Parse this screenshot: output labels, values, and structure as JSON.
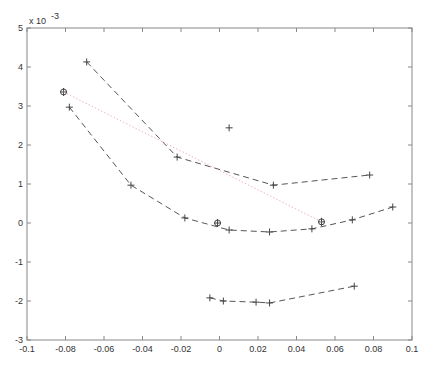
{
  "chart_data": {
    "type": "line",
    "xlabel": "",
    "ylabel": "",
    "y_scale_label": "x 10^-3",
    "xlim": [
      -0.1,
      0.1
    ],
    "ylim": [
      -3,
      5
    ],
    "y_multiplier": 0.001,
    "x_ticks": [
      -0.1,
      -0.08,
      -0.06,
      -0.04,
      -0.02,
      0,
      0.02,
      0.04,
      0.06,
      0.08,
      0.1
    ],
    "x_tick_labels": [
      "-0.1",
      "-0.08",
      "-0.06",
      "-0.04",
      "-0.02",
      "0",
      "0.02",
      "0.04",
      "0.06",
      "0.08",
      "0.1"
    ],
    "y_ticks": [
      -3,
      -2,
      -1,
      0,
      1,
      2,
      3,
      4,
      5
    ],
    "y_tick_labels": [
      "-3",
      "-2",
      "-1",
      "0",
      "1",
      "2",
      "3",
      "4",
      "5"
    ],
    "grid": false,
    "legend": null,
    "series": [
      {
        "name": "curve-upper",
        "style": "dashed",
        "marker": "+",
        "color": "#555555",
        "x": [
          -0.069,
          -0.022,
          0.028,
          0.078
        ],
        "y": [
          4.13,
          1.69,
          0.97,
          1.23
        ]
      },
      {
        "name": "curve-middle",
        "style": "dashed",
        "marker": "+",
        "color": "#555555",
        "x": [
          -0.078,
          -0.046,
          -0.018,
          0.005,
          0.026,
          0.048,
          0.069,
          0.09
        ],
        "y": [
          2.97,
          0.97,
          0.13,
          -0.18,
          -0.23,
          -0.15,
          0.08,
          0.41
        ]
      },
      {
        "name": "curve-lower",
        "style": "dashed",
        "marker": "+",
        "color": "#555555",
        "x": [
          -0.005,
          0.002,
          0.019,
          0.026,
          0.07
        ],
        "y": [
          -1.92,
          -2.0,
          -2.03,
          -2.05,
          -1.62
        ]
      },
      {
        "name": "isolated-point",
        "style": "none",
        "marker": "+",
        "color": "#555555",
        "x": [
          0.005
        ],
        "y": [
          2.44
        ]
      },
      {
        "name": "circled-markers",
        "style": "none",
        "marker": "circle-plus",
        "color": "#555555",
        "x": [
          -0.081,
          -0.001,
          0.053
        ],
        "y": [
          3.36,
          0.0,
          0.03
        ]
      },
      {
        "name": "dotted-link",
        "style": "dotted",
        "marker": "none",
        "color": "#e8b4c8",
        "x": [
          -0.081,
          0.053
        ],
        "y": [
          3.36,
          0.03
        ]
      }
    ]
  },
  "plot": {
    "left": 27,
    "right": 412,
    "top": 28,
    "bottom": 340,
    "axis_color": "#888888",
    "line_color": "#555555",
    "dotted_color": "#e8b4c8"
  }
}
